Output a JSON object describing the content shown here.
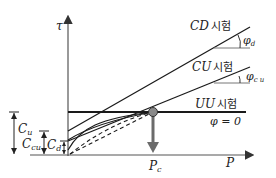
{
  "title_partial": "",
  "axes": {
    "y_label": "τ",
    "x_label": "P"
  },
  "lines": {
    "cd": {
      "label": "CD",
      "suffix": "시험",
      "angle_label": "φ",
      "angle_sub": "d"
    },
    "cu": {
      "label": "CU",
      "suffix": "시험",
      "angle_label": "φ",
      "angle_sub": "c u"
    },
    "uu": {
      "label": "UU",
      "suffix": "시험",
      "note": "φ = 0"
    }
  },
  "intercepts": {
    "cu": {
      "label": "C",
      "sub": "u"
    },
    "ccu": {
      "label": "C",
      "sub": "cu"
    },
    "cd": {
      "label": "C",
      "sub": "d"
    }
  },
  "marker": {
    "label": "P",
    "sub": "c"
  },
  "colors": {
    "line": "#1a1a1a",
    "axis": "#555555",
    "marker_arrow": "#6b6b6b",
    "marker_circle": "#8a8a8a"
  }
}
